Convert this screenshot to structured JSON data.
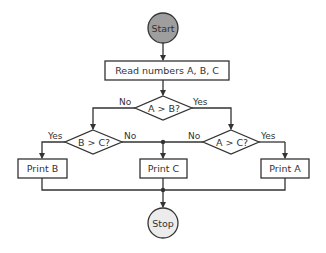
{
  "diagram": {
    "type": "flowchart",
    "colors": {
      "stroke": "#333333",
      "start_fill": "#9e9e9e",
      "stop_fill": "#ececec",
      "box_fill": "#ffffff"
    },
    "nodes": {
      "start": {
        "label": "Start",
        "shape": "circle"
      },
      "read": {
        "label": "Read numbers A, B, C",
        "shape": "rect"
      },
      "a_gt_b": {
        "label": "A > B?",
        "shape": "diamond"
      },
      "b_gt_c": {
        "label": "B > C?",
        "shape": "diamond"
      },
      "a_gt_c": {
        "label": "A > C?",
        "shape": "diamond"
      },
      "print_b": {
        "label": "Print B",
        "shape": "rect"
      },
      "print_c": {
        "label": "Print C",
        "shape": "rect"
      },
      "print_a": {
        "label": "Print A",
        "shape": "rect"
      },
      "stop": {
        "label": "Stop",
        "shape": "circle"
      }
    },
    "edges": {
      "a_gt_b_no": {
        "from": "a_gt_b",
        "to": "b_gt_c",
        "label": "No"
      },
      "a_gt_b_yes": {
        "from": "a_gt_b",
        "to": "a_gt_c",
        "label": "Yes"
      },
      "b_gt_c_yes": {
        "from": "b_gt_c",
        "to": "print_b",
        "label": "Yes"
      },
      "b_gt_c_no": {
        "from": "b_gt_c",
        "to": "print_c",
        "label": "No"
      },
      "a_gt_c_no": {
        "from": "a_gt_c",
        "to": "print_c",
        "label": "No"
      },
      "a_gt_c_yes": {
        "from": "a_gt_c",
        "to": "print_a",
        "label": "Yes"
      }
    }
  }
}
